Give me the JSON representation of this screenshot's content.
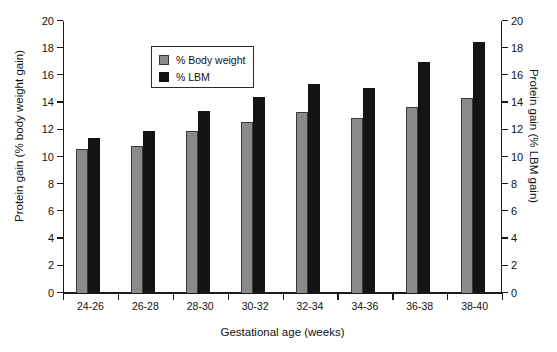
{
  "chart_data": {
    "type": "bar",
    "title": "",
    "xlabel": "Gestational age (weeks)",
    "ylabel": "Protein gain (% body weight gain)",
    "ylabel_right": "Protein gain (% LBM gain)",
    "categories": [
      "24-26",
      "26-28",
      "28-30",
      "30-32",
      "32-34",
      "34-36",
      "36-38",
      "38-40"
    ],
    "series": [
      {
        "name": "% Body weight",
        "color": "#8a8a8a",
        "values": [
          10.6,
          10.8,
          11.9,
          12.6,
          13.3,
          12.9,
          13.7,
          14.35
        ]
      },
      {
        "name": "% LBM",
        "color": "#141414",
        "values": [
          11.4,
          11.9,
          13.35,
          14.4,
          15.4,
          15.1,
          17.0,
          18.45
        ]
      }
    ],
    "ylim": [
      0,
      20
    ],
    "yticks": [
      0,
      2,
      4,
      6,
      8,
      10,
      12,
      14,
      16,
      18,
      20
    ],
    "ytick_labels": [
      "0",
      "2",
      "4",
      "6",
      "8",
      "10",
      "12",
      "14",
      "16",
      "18",
      "20"
    ],
    "ylim_right": [
      0,
      20
    ],
    "yticks_right": [
      0,
      2,
      4,
      6,
      8,
      10,
      12,
      14,
      16,
      18,
      20
    ],
    "ytick_labels_right": [
      "0",
      "2",
      "4",
      "6",
      "8",
      "10",
      "12",
      "14",
      "16",
      "18",
      "20"
    ],
    "grid": false,
    "legend_position": "upper left",
    "legend_entries": [
      "% Body weight",
      "% LBM"
    ]
  }
}
